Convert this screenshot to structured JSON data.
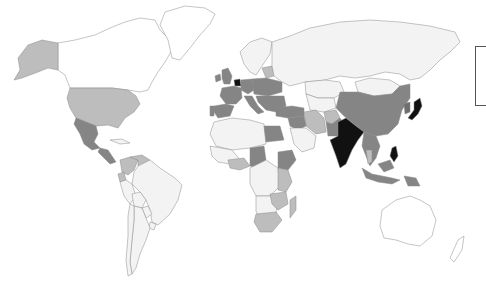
{
  "map": {
    "type": "choropleth",
    "projection": "world",
    "palette": {
      "none": "#ffffff",
      "level1": "#f3f3f3",
      "level2": "#bdbdbd",
      "level3": "#858585",
      "level4": "#6e6e6e",
      "level5": "#111111"
    },
    "regions": [
      {
        "name": "Canada",
        "level": "none"
      },
      {
        "name": "Greenland",
        "level": "none"
      },
      {
        "name": "Alaska (USA)",
        "level": "level2"
      },
      {
        "name": "United States",
        "level": "level2"
      },
      {
        "name": "Mexico",
        "level": "level3"
      },
      {
        "name": "Central America",
        "level": "level3"
      },
      {
        "name": "Cuba",
        "level": "level1"
      },
      {
        "name": "Colombia",
        "level": "level2"
      },
      {
        "name": "Venezuela",
        "level": "level2"
      },
      {
        "name": "Ecuador",
        "level": "level2"
      },
      {
        "name": "Brazil",
        "level": "level1"
      },
      {
        "name": "Peru",
        "level": "level1"
      },
      {
        "name": "Bolivia",
        "level": "level1"
      },
      {
        "name": "Argentina",
        "level": "level1"
      },
      {
        "name": "Chile",
        "level": "level1"
      },
      {
        "name": "Paraguay",
        "level": "level1"
      },
      {
        "name": "Uruguay",
        "level": "level1"
      },
      {
        "name": "United Kingdom",
        "level": "level3"
      },
      {
        "name": "Ireland",
        "level": "level3"
      },
      {
        "name": "France",
        "level": "level3"
      },
      {
        "name": "Spain",
        "level": "level3"
      },
      {
        "name": "Portugal",
        "level": "level3"
      },
      {
        "name": "Benelux",
        "level": "level5"
      },
      {
        "name": "Germany",
        "level": "level3"
      },
      {
        "name": "Italy",
        "level": "level3"
      },
      {
        "name": "Central Europe",
        "level": "level3"
      },
      {
        "name": "Balkans",
        "level": "level3"
      },
      {
        "name": "Scandinavia",
        "level": "level1"
      },
      {
        "name": "Baltics",
        "level": "level2"
      },
      {
        "name": "Russia",
        "level": "level1"
      },
      {
        "name": "Turkey",
        "level": "level3"
      },
      {
        "name": "Kazakhstan",
        "level": "level1"
      },
      {
        "name": "Central Asia",
        "level": "level1"
      },
      {
        "name": "Iran",
        "level": "level2"
      },
      {
        "name": "Afghanistan",
        "level": "level2"
      },
      {
        "name": "Pakistan",
        "level": "level3"
      },
      {
        "name": "India",
        "level": "level5"
      },
      {
        "name": "China",
        "level": "level3"
      },
      {
        "name": "Mongolia",
        "level": "level1"
      },
      {
        "name": "Korea",
        "level": "level4"
      },
      {
        "name": "Japan",
        "level": "level5"
      },
      {
        "name": "Southeast Asia",
        "level": "level3"
      },
      {
        "name": "Thailand",
        "level": "level2"
      },
      {
        "name": "Philippines",
        "level": "level5"
      },
      {
        "name": "Indonesia",
        "level": "level3"
      },
      {
        "name": "Papua New Guinea",
        "level": "level3"
      },
      {
        "name": "Australia",
        "level": "none"
      },
      {
        "name": "New Zealand",
        "level": "none"
      },
      {
        "name": "Saudi Arabia",
        "level": "level1"
      },
      {
        "name": "Iraq/Syria",
        "level": "level3"
      },
      {
        "name": "Egypt",
        "level": "level3"
      },
      {
        "name": "North Africa",
        "level": "level1"
      },
      {
        "name": "West Africa",
        "level": "level1"
      },
      {
        "name": "Ghana/Nigeria",
        "level": "level2"
      },
      {
        "name": "Cameroon/Chad",
        "level": "level3"
      },
      {
        "name": "Ethiopia",
        "level": "level3"
      },
      {
        "name": "Kenya/Tanzania",
        "level": "level2"
      },
      {
        "name": "Central Africa",
        "level": "level1"
      },
      {
        "name": "Southern Africa",
        "level": "level1"
      },
      {
        "name": "Zambia/Zimbabwe",
        "level": "level2"
      },
      {
        "name": "South Africa",
        "level": "level2"
      },
      {
        "name": "Madagascar",
        "level": "level2"
      }
    ]
  },
  "legend": {
    "visible": true,
    "clipped": true,
    "entries": []
  }
}
